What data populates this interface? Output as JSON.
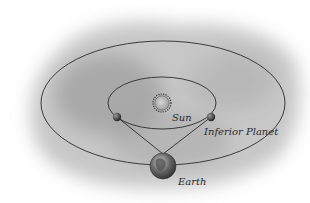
{
  "diagram": {
    "type": "orbital-diagram",
    "labels": {
      "sun": "Sun",
      "inferior_planet": "Inferior Planet",
      "earth": "Earth"
    },
    "colors": {
      "background_cloud": "#9a9a9a",
      "orbit_line": "#2b2b2b",
      "sun_fill": "#b8b8b8",
      "planet_fill": "#4a4a4a",
      "earth_fill": "#6d6d6d"
    },
    "elements": {
      "outer_orbit": "Earth orbit",
      "inner_orbit": "Inferior planet orbit",
      "sight_lines": 2
    }
  }
}
